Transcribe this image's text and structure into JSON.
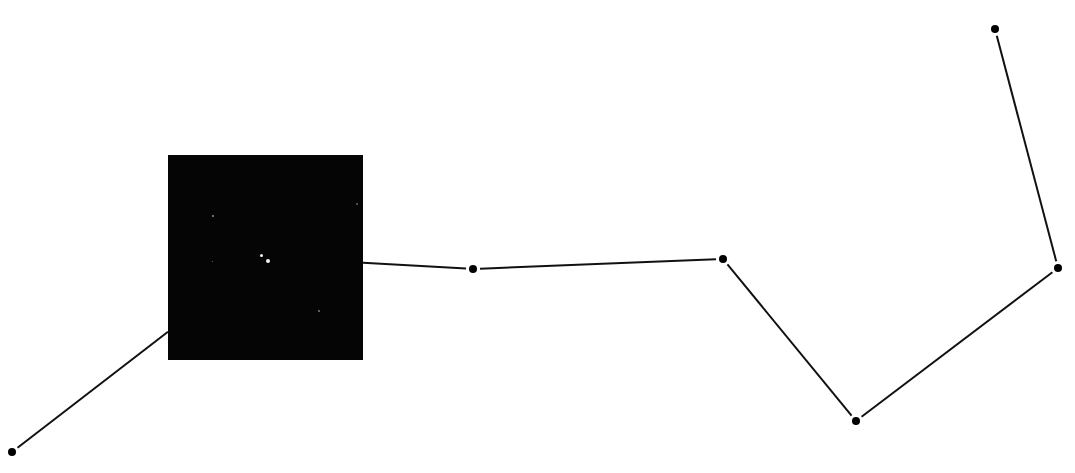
{
  "diagram": {
    "type": "constellation-chart",
    "line_color": "#111111",
    "star_color": "#000000",
    "background": "#ffffff",
    "stars": [
      {
        "id": "s1",
        "role": "handle-end"
      },
      {
        "id": "s2",
        "role": "handle-middle",
        "shown_as": "photo-inset"
      },
      {
        "id": "s3",
        "role": "handle-bowl-joint"
      },
      {
        "id": "s4",
        "role": "bowl"
      },
      {
        "id": "s5",
        "role": "bowl"
      },
      {
        "id": "s6",
        "role": "bowl"
      },
      {
        "id": "s7",
        "role": "bowl-pointer"
      }
    ],
    "connections": [
      [
        "s1",
        "s2"
      ],
      [
        "s2",
        "s3"
      ],
      [
        "s3",
        "s4"
      ],
      [
        "s4",
        "s5"
      ],
      [
        "s5",
        "s6"
      ],
      [
        "s6",
        "s7"
      ]
    ],
    "inset_photo": {
      "subject": "double-star",
      "background": "#050505",
      "star_color": "#f4f4f4"
    }
  }
}
